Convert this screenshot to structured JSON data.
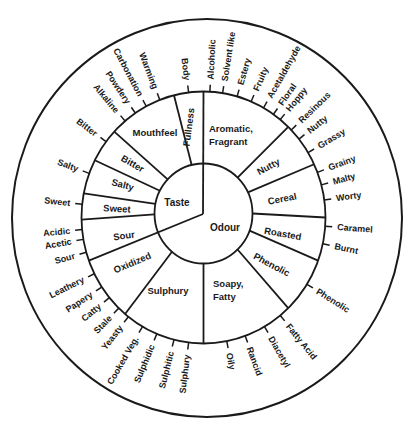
{
  "style": {
    "ink": "#1a1a1a",
    "background": "#ffffff"
  },
  "wheel": {
    "geometry": {
      "hub": {
        "x": 203,
        "y": 214
      },
      "inner": {
        "cx": 203.5,
        "cy": 213.5,
        "rx": 49,
        "ry": 50
      },
      "middle": {
        "cx": 203.5,
        "cy": 217.5,
        "rx": 122,
        "ry": 126
      },
      "outer": {
        "cx": 207,
        "cy": 218,
        "rx": 195,
        "ry": 199
      },
      "tick_length": 7,
      "label_offset": 12
    },
    "inner": {
      "dividers": [
        0,
        250
      ],
      "sectors": [
        {
          "label": "Taste",
          "x": 177,
          "y": 202
        },
        {
          "label": "Odour",
          "x": 225,
          "y": 227
        }
      ]
    },
    "middle_dividers": [
      44,
      65,
      90,
      110,
      136,
      180,
      220,
      269,
      281,
      297,
      313,
      346
    ],
    "categories": [
      {
        "id": "aromatic-fragrant",
        "lines": [
          "Aromatic,",
          "Fragrant"
        ],
        "x": 209,
        "y": 128,
        "anchor": "start",
        "rotate": 0,
        "descriptors": [
          {
            "label": "Alcoholic",
            "angle": 3
          },
          {
            "label": "Solvent like",
            "angle": 9
          },
          {
            "label": "Estery",
            "angle": 16
          },
          {
            "label": "Fruity",
            "angle": 23
          },
          {
            "label": "Acetaldehyde",
            "angle": 29.5
          },
          {
            "label": "Floral",
            "angle": 35
          },
          {
            "label": "Hoppy",
            "angle": 39
          }
        ]
      },
      {
        "id": "nutty",
        "lines": [
          "Nutty"
        ],
        "x": 268,
        "y": 166,
        "anchor": "middle",
        "rotate": -28,
        "descriptors": [
          {
            "label": "Resinous",
            "angle": 46
          },
          {
            "label": "Nutty",
            "angle": 51.5
          },
          {
            "label": "Grassy",
            "angle": 59
          }
        ]
      },
      {
        "id": "cereal",
        "lines": [
          "Cereal"
        ],
        "x": 282,
        "y": 198,
        "anchor": "middle",
        "rotate": -11,
        "descriptors": [
          {
            "label": "Grainy",
            "angle": 69
          },
          {
            "label": "Malty",
            "angle": 75
          },
          {
            "label": "Worty",
            "angle": 82
          }
        ]
      },
      {
        "id": "roasted",
        "lines": [
          "Roasted"
        ],
        "x": 283,
        "y": 233,
        "anchor": "middle",
        "rotate": 10,
        "descriptors": [
          {
            "label": "Caramel",
            "angle": 94
          },
          {
            "label": "Burnt",
            "angle": 102
          }
        ]
      },
      {
        "id": "phenolic",
        "lines": [
          "Phenolic"
        ],
        "x": 272,
        "y": 264,
        "anchor": "middle",
        "rotate": 28,
        "descriptors": [
          {
            "label": "Phenolic",
            "angle": 122
          }
        ]
      },
      {
        "id": "soapy-fatty",
        "lines": [
          "Soapy,",
          "Fatty"
        ],
        "x": 213,
        "y": 283,
        "anchor": "start",
        "rotate": 0,
        "descriptors": [
          {
            "label": "Fatty Acid",
            "angle": 141
          },
          {
            "label": "Diacetyl",
            "angle": 150
          },
          {
            "label": "Rancid",
            "angle": 160
          },
          {
            "label": "Oily",
            "angle": 169
          }
        ]
      },
      {
        "id": "sulphury",
        "lines": [
          "Sulphury"
        ],
        "x": 168,
        "y": 290,
        "anchor": "middle",
        "rotate": 0,
        "descriptors": [
          {
            "label": "Sulphury",
            "angle": 187
          },
          {
            "label": "Sulphitic",
            "angle": 194
          },
          {
            "label": "Sulphidic",
            "angle": 202.5
          },
          {
            "label": "Cooked Veg.",
            "angle": 210
          },
          {
            "label": "Yeasty",
            "angle": 218
          }
        ]
      },
      {
        "id": "oxidized",
        "lines": [
          "Oxidized"
        ],
        "x": 132,
        "y": 262,
        "anchor": "middle",
        "rotate": -23,
        "descriptors": [
          {
            "label": "Stale",
            "angle": 224
          },
          {
            "label": "Catty",
            "angle": 230.5
          },
          {
            "label": "Papery",
            "angle": 236.5
          },
          {
            "label": "Leathery",
            "angle": 243.5
          }
        ]
      },
      {
        "id": "sour",
        "lines": [
          "Sour"
        ],
        "x": 124,
        "y": 235,
        "anchor": "middle",
        "rotate": -8,
        "descriptors": [
          {
            "label": "Sour",
            "angle": 254
          },
          {
            "label": "Acetic",
            "angle": 260
          },
          {
            "label": "Acidic",
            "angle": 264.5
          }
        ]
      },
      {
        "id": "sweet",
        "lines": [
          "Sweet"
        ],
        "x": 117,
        "y": 208,
        "anchor": "middle",
        "rotate": 3,
        "descriptors": [
          {
            "label": "Sweet",
            "angle": 276
          }
        ]
      },
      {
        "id": "salty",
        "lines": [
          "Salty"
        ],
        "x": 123,
        "y": 184,
        "anchor": "middle",
        "rotate": 15,
        "descriptors": [
          {
            "label": "Salty",
            "angle": 290.5
          }
        ]
      },
      {
        "id": "bitter",
        "lines": [
          "Bitter"
        ],
        "x": 133,
        "y": 163,
        "anchor": "middle",
        "rotate": 30,
        "descriptors": [
          {
            "label": "Bitter",
            "angle": 307
          }
        ]
      },
      {
        "id": "mouthfeel",
        "lines": [
          "Mouthfeel"
        ],
        "x": 155,
        "y": 132,
        "anchor": "middle",
        "rotate": 0,
        "descriptors": [
          {
            "label": "Alkaline",
            "angle": 320
          },
          {
            "label": "Powdery",
            "angle": 326
          },
          {
            "label": "Carbonation",
            "angle": 332
          },
          {
            "label": "Warming",
            "angle": 339
          }
        ]
      },
      {
        "id": "fullness",
        "lines": [
          "Fullness"
        ],
        "x": 188,
        "y": 127,
        "anchor": "middle",
        "rotate": -83,
        "descriptors": [
          {
            "label": "Body",
            "angle": 353
          }
        ]
      }
    ]
  }
}
